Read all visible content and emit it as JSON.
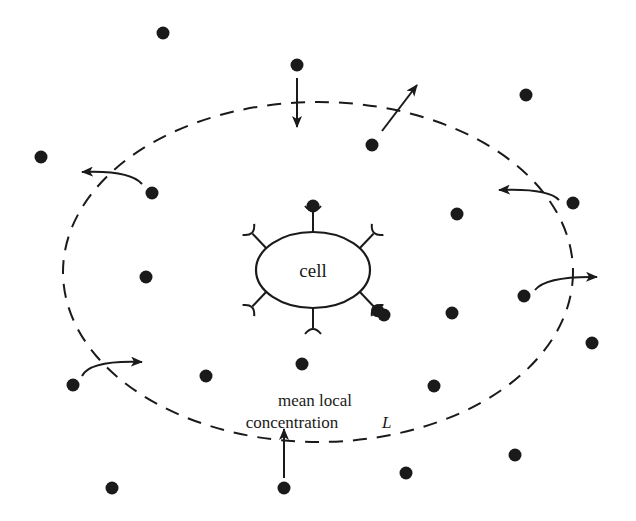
{
  "diagram": {
    "type": "cell-receptor-ligand-schematic",
    "cell_label": "cell",
    "region_label_line1": "mean local",
    "region_label_line2": "concentration",
    "region_symbol": "L",
    "colors": {
      "ink": "#1a1a1a",
      "background": "#ffffff"
    },
    "boundary": {
      "style": "dashed-ellipse",
      "cx": 318,
      "cy": 272,
      "rx": 255,
      "ry": 170
    },
    "cell": {
      "cx": 313,
      "cy": 270,
      "rx": 57,
      "ry": 38
    },
    "receptors": [
      {
        "angle": -90,
        "bound": true
      },
      {
        "angle": -35,
        "bound": false
      },
      {
        "angle": 35,
        "bound": true
      },
      {
        "angle": 90,
        "bound": false
      },
      {
        "angle": 145,
        "bound": false
      },
      {
        "angle": -145,
        "bound": false
      }
    ],
    "ligands": [
      [
        163,
        33
      ],
      [
        297,
        65
      ],
      [
        526,
        95
      ],
      [
        41,
        157
      ],
      [
        372,
        145
      ],
      [
        152,
        193
      ],
      [
        457,
        214
      ],
      [
        573,
        203
      ],
      [
        146,
        277
      ],
      [
        524,
        296
      ],
      [
        452,
        313
      ],
      [
        384,
        315
      ],
      [
        592,
        343
      ],
      [
        302,
        364
      ],
      [
        206,
        376
      ],
      [
        434,
        386
      ],
      [
        73,
        385
      ],
      [
        515,
        455
      ],
      [
        406,
        473
      ],
      [
        112,
        488
      ],
      [
        284,
        488
      ]
    ],
    "flux_arrows": [
      {
        "direction": "in",
        "from": [
          297,
          78
        ],
        "to": [
          297,
          126
        ]
      },
      {
        "direction": "out",
        "from": [
          382,
          130
        ],
        "to": [
          416,
          86
        ]
      },
      {
        "direction": "out",
        "curve": true,
        "from": [
          145,
          184
        ],
        "to": [
          82,
          172
        ]
      },
      {
        "direction": "out",
        "curve": true,
        "from": [
          560,
          200
        ],
        "to": [
          500,
          190
        ]
      },
      {
        "direction": "out",
        "curve": true,
        "from": [
          535,
          290
        ],
        "to": [
          597,
          277
        ]
      },
      {
        "direction": "in",
        "curve": true,
        "from": [
          82,
          376
        ],
        "to": [
          142,
          362
        ]
      },
      {
        "direction": "in",
        "from": [
          284,
          478
        ],
        "to": [
          284,
          430
        ]
      }
    ]
  }
}
